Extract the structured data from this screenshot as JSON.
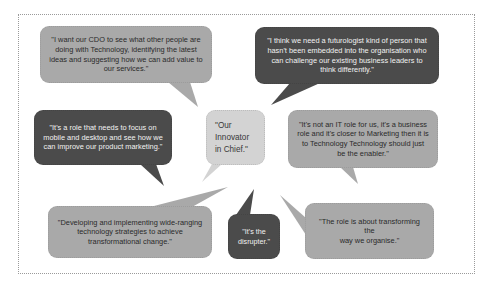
{
  "diagram": {
    "colors": {
      "frame_border": "#9a9a9a",
      "medium_bubble": "#a9a9a9",
      "dark_bubble": "#4b4b4b",
      "light_bubble": "#d3d3d3",
      "dark_text": "#2a2a2a",
      "light_text": "#f2f2f2"
    },
    "center": {
      "text": "\"Our\nInnovator\nin Chief.\""
    },
    "quotes": [
      {
        "id": "cdo-see-what-others-do",
        "style": "medium",
        "text": "\"I want our CDO to see what other people are doing with Technology, identifying the latest ideas and suggesting how we can add value to our services.\""
      },
      {
        "id": "futurologist",
        "style": "dark",
        "text": "\"I think we need a futurologist kind of person that hasn't been embedded into the organisation who can challenge our existing business leaders to think differently.\""
      },
      {
        "id": "mobile-desktop",
        "style": "dark",
        "text": "\"It's a role that needs to focus on mobile and desktop and see how we can improve our product marketing.\""
      },
      {
        "id": "not-it-role",
        "style": "medium",
        "text": "\"It's not an IT role for us, it's a business role and it's closer to Marketing then it is to Technology Technology should just be the enabler.\""
      },
      {
        "id": "developing-strategies",
        "style": "medium",
        "text": "\"Developing and implementing wide-ranging technology strategies to achieve transformational change.\""
      },
      {
        "id": "disrupter",
        "style": "dark",
        "text": "\"It's the\ndisrupter.\""
      },
      {
        "id": "transforming-organise",
        "style": "medium",
        "text": "\"The role is about transforming the\nway we organise.\""
      }
    ]
  }
}
